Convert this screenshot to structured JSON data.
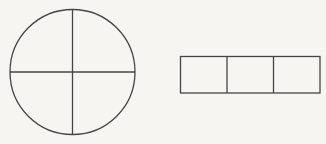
{
  "canvas": {
    "width": 326,
    "height": 144,
    "background": "#f6f5f2",
    "stroke_color": "#454545",
    "stroke_width": 1.3
  },
  "shapes": {
    "quartered_circle": {
      "description": "circle divided into four quarters by one horizontal and one vertical diameter",
      "cx": 72.5,
      "cy": 72,
      "r": 62.5,
      "dividers": [
        "horizontal",
        "vertical"
      ]
    },
    "thirds_strip": {
      "description": "horizontal rectangle divided into three equal cells",
      "x": 180.5,
      "y": 56.5,
      "width": 139.5,
      "height": 36.5,
      "cells": 3
    }
  }
}
